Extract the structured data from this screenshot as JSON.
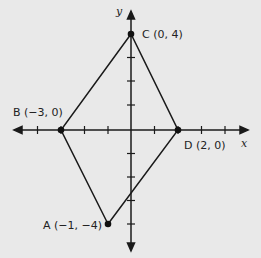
{
  "diagram": {
    "type": "coordinate-plane-quadrilateral",
    "axes": {
      "x_label": "x",
      "y_label": "y",
      "x_range": [
        -5,
        4
      ],
      "y_range": [
        -5,
        5
      ],
      "tick_spacing": 1
    },
    "points": [
      {
        "name": "A",
        "x": -1,
        "y": -4,
        "label": "A (−1, −4)"
      },
      {
        "name": "B",
        "x": -3,
        "y": 0,
        "label": "B (−3, 0)"
      },
      {
        "name": "C",
        "x": 0,
        "y": 4,
        "label": "C (0, 4)"
      },
      {
        "name": "D",
        "x": 2,
        "y": 0,
        "label": "D (2, 0)"
      }
    ],
    "polygon": [
      "A",
      "B",
      "C",
      "D"
    ],
    "colors": {
      "background": "#e9e9e9",
      "lines": "#1a1a1a"
    }
  }
}
